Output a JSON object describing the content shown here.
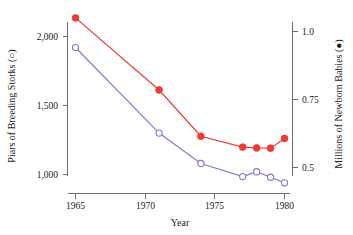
{
  "chart_data": {
    "type": "line",
    "title": "",
    "xlabel": "Year",
    "x": [
      1965,
      1971,
      1974,
      1977,
      1978,
      1979,
      1980
    ],
    "xlim": [
      1963.5,
      1981.5
    ],
    "xticks": [
      1965,
      1970,
      1975,
      1980
    ],
    "xticklabels": [
      "1965",
      "1970",
      "1975",
      "1980"
    ],
    "grid": false,
    "legend": "none",
    "series": [
      {
        "name": "Piars of Breeding Storks",
        "marker": "open-circle",
        "color": "#7b7fc4",
        "axis": "left",
        "ylabel": "Piars of Breeding Storks (○)",
        "ylim": [
          850,
          2120
        ],
        "yticks": [
          1000,
          1500,
          2000
        ],
        "yticklabels": [
          "1,000",
          "1,500",
          "2,000"
        ],
        "values": [
          1920,
          1300,
          1080,
          985,
          1020,
          980,
          940
        ]
      },
      {
        "name": "Millions of Newborn Babies",
        "marker": "filled-circle",
        "color": "#ee3b33",
        "axis": "right",
        "ylabel": "Millions of Newborn Babies (●)",
        "ylim": [
          0.44,
          1.07
        ],
        "yticks": [
          0.5,
          0.75,
          1.0
        ],
        "yticklabels": [
          "0.5",
          "0.75",
          "1.0"
        ],
        "values": [
          1.05,
          0.785,
          0.615,
          0.575,
          0.572,
          0.571,
          0.607
        ]
      }
    ]
  },
  "axes": {
    "left": {
      "title": "Piars of Breeding Storks (○)",
      "ticks": [
        "2,000",
        "1,500",
        "1,000"
      ]
    },
    "right": {
      "title": "Millions of Newborn Babies (●)",
      "ticks": [
        "1.0",
        "0.75",
        "0.5"
      ]
    },
    "bottom": {
      "title": "Year",
      "ticks": [
        "1965",
        "1970",
        "1975",
        "1980"
      ]
    }
  }
}
